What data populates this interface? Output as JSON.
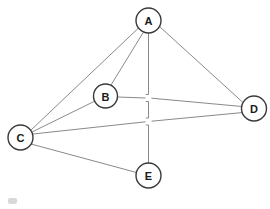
{
  "diagram": {
    "background_color": "#ffffff",
    "edge_color": "#8a8a8a",
    "node_stroke_color": "#3a3a3a",
    "node_fill_color": "#ffffff",
    "label_color": "#1a1a1a"
  },
  "nodes": [
    {
      "id": "A",
      "label": "A",
      "cx": 148.5,
      "cy": 20.5,
      "r": 12.5
    },
    {
      "id": "B",
      "label": "B",
      "cx": 105.5,
      "cy": 96.0,
      "r": 12.0
    },
    {
      "id": "C",
      "label": "C",
      "cx": 20.5,
      "cy": 137.5,
      "r": 12.5
    },
    {
      "id": "D",
      "label": "D",
      "cx": 254.0,
      "cy": 108.5,
      "r": 12.5
    },
    {
      "id": "E",
      "label": "E",
      "cx": 148.5,
      "cy": 175.5,
      "r": 12.5
    }
  ],
  "edges": [
    {
      "from": "A",
      "to": "B",
      "label": ""
    },
    {
      "from": "A",
      "to": "C",
      "label": ""
    },
    {
      "from": "A",
      "to": "D",
      "label": ""
    },
    {
      "from": "A",
      "to": "E",
      "label": "",
      "crossings": [
        "B-D",
        "C-D"
      ]
    },
    {
      "from": "B",
      "to": "C",
      "label": ""
    },
    {
      "from": "B",
      "to": "D",
      "label": ""
    },
    {
      "from": "C",
      "to": "D",
      "label": ""
    },
    {
      "from": "C",
      "to": "E",
      "label": ""
    }
  ],
  "crossing_gaps": [
    {
      "x": 148.5,
      "y": 98.0,
      "crossing_edge": "B-D"
    },
    {
      "x": 148.5,
      "y": 121.5,
      "crossing_edge": "C-D"
    }
  ]
}
